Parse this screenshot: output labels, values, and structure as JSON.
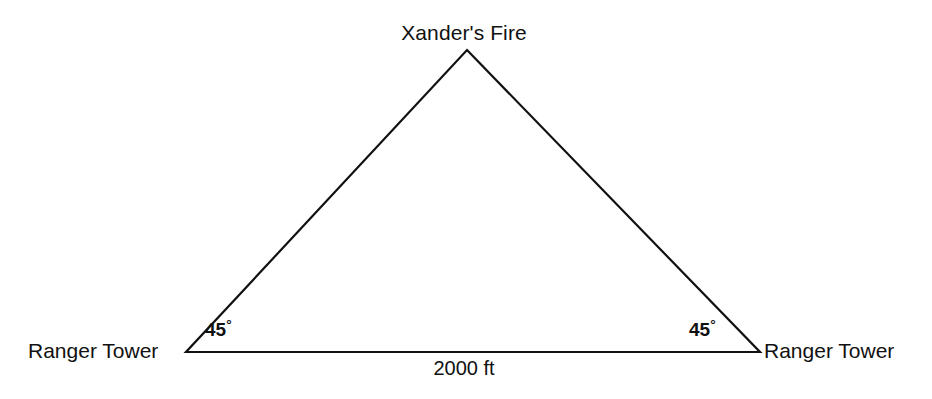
{
  "figure": {
    "type": "geometry-diagram",
    "shape": "isosceles-triangle",
    "background_color": "#ffffff",
    "stroke_color": "#111111",
    "stroke_width": 2.2
  },
  "labels": {
    "apex": "Xander's Fire",
    "left_vertex": "Ranger Tower",
    "right_vertex": "Ranger Tower",
    "left_angle": "45",
    "right_angle": "45",
    "degree_symbol": "°",
    "base_length": "2000 ft"
  },
  "geometry": {
    "apex": {
      "x": 467,
      "y": 50
    },
    "left_vertex": {
      "x": 186,
      "y": 352
    },
    "right_vertex": {
      "x": 760,
      "y": 352
    },
    "base_label_value": 2000,
    "base_label_unit": "ft",
    "left_angle_degrees": 45,
    "right_angle_degrees": 45,
    "apex_angle_degrees": 90
  }
}
